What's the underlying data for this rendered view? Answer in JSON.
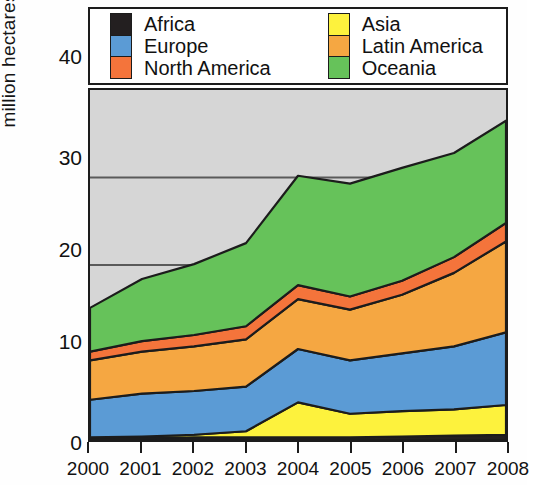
{
  "chart_data": {
    "type": "area",
    "stacked": true,
    "title": "",
    "subtitle": "",
    "xlabel": "",
    "ylabel": "million hectares",
    "categories": [
      "2000",
      "2001",
      "2002",
      "2003",
      "2004",
      "2005",
      "2006",
      "2007",
      "2008"
    ],
    "x": [
      2000,
      2001,
      2002,
      2003,
      2004,
      2005,
      2006,
      2007,
      2008
    ],
    "xtick_labels": [
      "2000",
      "2001",
      "2002",
      "2003",
      "2004",
      "2005",
      "2006",
      "2007",
      "2008"
    ],
    "ytick_labels": [
      "0",
      "10",
      "20",
      "30",
      "40"
    ],
    "yticks": [
      0,
      10,
      20,
      30,
      40
    ],
    "ylim": [
      0,
      40
    ],
    "xlim": [
      2000,
      2008
    ],
    "grid": "horizontal",
    "gridlines": [
      20,
      30
    ],
    "legend_position": "top",
    "legend_entries": [
      "Africa",
      "Europe",
      "North America",
      "Asia",
      "Latin America",
      "Oceania"
    ],
    "stack_order_bottom_to_top": [
      "Africa",
      "Asia",
      "Europe",
      "Latin America",
      "North America",
      "Oceania"
    ],
    "plot_background_color": "#d6d6d6",
    "series": [
      {
        "name": "Africa",
        "color": "#231f20",
        "values": [
          0.2,
          0.2,
          0.3,
          0.3,
          0.3,
          0.3,
          0.4,
          0.5,
          0.6
        ]
      },
      {
        "name": "Asia",
        "color": "#fdf23d",
        "values": [
          0.1,
          0.2,
          0.3,
          0.7,
          4.0,
          2.7,
          2.9,
          3.0,
          3.4
        ]
      },
      {
        "name": "Europe",
        "color": "#5b9bd5",
        "values": [
          4.3,
          4.9,
          5.0,
          5.1,
          6.1,
          6.1,
          6.6,
          7.2,
          8.3
        ]
      },
      {
        "name": "Latin America",
        "color": "#f5a742",
        "values": [
          4.5,
          4.8,
          5.1,
          5.4,
          5.7,
          5.8,
          6.7,
          8.4,
          10.4
        ]
      },
      {
        "name": "North America",
        "color": "#f4743b",
        "values": [
          1.0,
          1.2,
          1.3,
          1.5,
          1.6,
          1.5,
          1.6,
          1.8,
          2.1
        ]
      },
      {
        "name": "Oceania",
        "color": "#66c25a",
        "values": [
          5.0,
          7.1,
          8.1,
          9.5,
          12.5,
          12.9,
          12.9,
          11.9,
          11.7
        ]
      }
    ],
    "totals": [
      15.1,
      18.4,
      20.1,
      22.5,
      30.2,
      29.3,
      31.1,
      32.8,
      36.5
    ]
  },
  "yaxis": {
    "title": "million hectares",
    "ticks": [
      "40",
      "30",
      "20",
      "10",
      "0"
    ]
  },
  "xaxis": {
    "ticks": [
      "2000",
      "2001",
      "2002",
      "2003",
      "2004",
      "2005",
      "2006",
      "2007",
      "2008"
    ]
  },
  "legend": {
    "left_column": [
      {
        "label": "Africa",
        "color": "#231f20"
      },
      {
        "label": "Europe",
        "color": "#5b9bd5"
      },
      {
        "label": "North America",
        "color": "#f4743b"
      }
    ],
    "right_column": [
      {
        "label": "Asia",
        "color": "#fdf23d"
      },
      {
        "label": "Latin America",
        "color": "#f5a742"
      },
      {
        "label": "Oceania",
        "color": "#66c25a"
      }
    ]
  },
  "colors": {
    "africa": "#231f20",
    "asia": "#fdf23d",
    "europe": "#5b9bd5",
    "latin_america": "#f5a742",
    "north_america": "#f4743b",
    "oceania": "#66c25a",
    "plot_background": "#d6d6d6",
    "axis": "#1c1c1c",
    "gridline": "#5a5a5a"
  }
}
